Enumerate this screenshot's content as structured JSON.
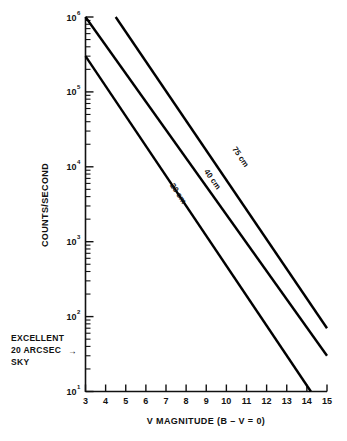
{
  "chart_data": {
    "type": "line",
    "title": "",
    "xlabel": "V MAGNITUDE (B – V = 0)",
    "ylabel": "COUNTS/SECOND",
    "xlim": [
      3,
      15
    ],
    "ylim": [
      10,
      1000000
    ],
    "yscale": "log",
    "grid": false,
    "legend_position": "inline-curve-labels",
    "xticks": [
      "3",
      "4",
      "5",
      "6",
      "7",
      "8",
      "9",
      "10",
      "11",
      "12",
      "13",
      "14",
      "15"
    ],
    "yticks": [
      {
        "label": "10",
        "exponent": "1",
        "value": 10
      },
      {
        "label": "10",
        "exponent": "2",
        "value": 100
      },
      {
        "label": "10",
        "exponent": "3",
        "value": 1000
      },
      {
        "label": "10",
        "exponent": "4",
        "value": 10000
      },
      {
        "label": "10",
        "exponent": "5",
        "value": 100000
      },
      {
        "label": "10",
        "exponent": "6",
        "value": 1000000
      }
    ],
    "series": [
      {
        "name": "75 cm",
        "label": "75 cm",
        "points": [
          [
            4.5,
            1000000
          ],
          [
            15,
            70
          ]
        ],
        "label_x": 10.6,
        "label_y": 13000
      },
      {
        "name": "40 cm",
        "label": "40 cm",
        "points": [
          [
            3.0,
            1000000
          ],
          [
            15,
            30
          ]
        ],
        "label_x": 9.2,
        "label_y": 6500
      },
      {
        "name": "20 cm",
        "label": "20 cm",
        "points": [
          [
            3.0,
            300000
          ],
          [
            14.2,
            10
          ]
        ],
        "label_x": 7.5,
        "label_y": 4200
      }
    ],
    "annotations": [
      {
        "name": "sky-brightness-annotation",
        "lines": [
          "EXCELLENT",
          "20 ARCSEC",
          "SKY"
        ],
        "arrow": true,
        "points_to_value": 40,
        "arrow_symbol": "→"
      }
    ]
  }
}
